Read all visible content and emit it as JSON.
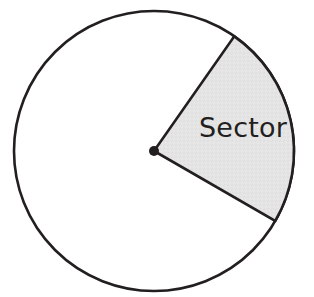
{
  "figure": {
    "background_color": "#ffffff"
  },
  "chart_data": {
    "type": "pie",
    "title": "",
    "subtitle": "",
    "xlabel": "",
    "ylabel": "",
    "grid": false,
    "legend_position": "none",
    "units": "degrees",
    "total_degrees": 360,
    "categories": [
      "Sector",
      "Remainder"
    ],
    "values": [
      85,
      275
    ],
    "percentages": [
      23.6,
      76.4
    ],
    "labels": [
      "Sector",
      ""
    ],
    "colors": [
      "#e3e3e3",
      "#ffffff"
    ],
    "annotations": [
      {
        "text": "Sector",
        "x": 243,
        "y": 128,
        "target": "shaded-sector"
      }
    ],
    "geometry": {
      "center_x": 154,
      "center_y": 151,
      "radius": 140,
      "start_angle_deg": -55,
      "end_angle_deg": 30,
      "sweep_deg": 85,
      "arc_start_point": [
        234,
        36
      ],
      "arc_end_point": [
        275,
        221
      ],
      "stroke_color": "#231f20",
      "stroke_width": 2.6,
      "fill_color": "#e3e3e3",
      "center_dot_radius": 5,
      "center_dot_color": "#231f20"
    }
  },
  "labels": {
    "sector_text": "Sector"
  },
  "colors": {
    "outline": "#231f20",
    "sector_fill": "#e3e3e3",
    "text": "#231f20",
    "canvas": "#ffffff"
  }
}
